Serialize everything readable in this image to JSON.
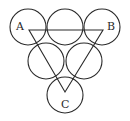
{
  "diagram": {
    "stroke_color": "#2a2a2a",
    "background": "#ffffff",
    "labels": {
      "A": "A",
      "B": "B",
      "C": "C"
    },
    "circles": [
      {
        "id": "top-left",
        "cx": 28,
        "cy": 27,
        "r": 18
      },
      {
        "id": "top-middle",
        "cx": 65,
        "cy": 27,
        "r": 18
      },
      {
        "id": "top-right",
        "cx": 102,
        "cy": 27,
        "r": 18
      },
      {
        "id": "middle-left",
        "cx": 46,
        "cy": 61,
        "r": 18
      },
      {
        "id": "middle-right",
        "cx": 84,
        "cy": 61,
        "r": 18
      },
      {
        "id": "bottom",
        "cx": 65,
        "cy": 95,
        "r": 18
      }
    ],
    "triangle": {
      "A": {
        "x": 29,
        "y": 30
      },
      "B": {
        "x": 103,
        "y": 30
      },
      "C": {
        "x": 65,
        "y": 92
      }
    }
  }
}
